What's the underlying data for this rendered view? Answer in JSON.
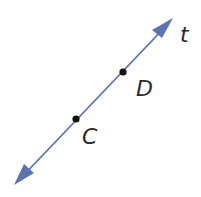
{
  "diagram": {
    "type": "line",
    "line_label": "t",
    "color": "#5b73b5",
    "endpoints": {
      "start": [
        16,
        183
      ],
      "end": [
        172,
        20
      ]
    },
    "points": [
      {
        "label": "D",
        "x": 123,
        "y": 72
      },
      {
        "label": "C",
        "x": 76,
        "y": 119
      }
    ]
  }
}
